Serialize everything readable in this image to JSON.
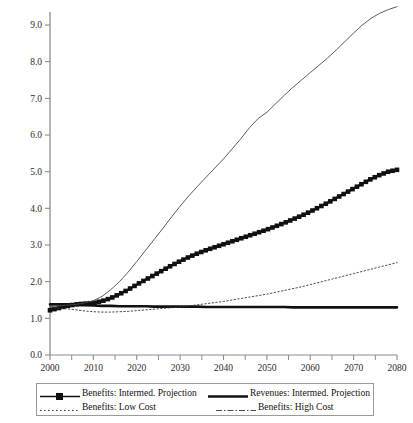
{
  "chart_data": {
    "type": "line",
    "title": "",
    "xlabel": "",
    "ylabel": "",
    "xlim": [
      2000,
      2080
    ],
    "ylim": [
      0.0,
      9.5
    ],
    "grid": false,
    "legend_position": "bottom",
    "x_ticks_major": [
      2000,
      2010,
      2020,
      2030,
      2040,
      2050,
      2060,
      2070,
      2080
    ],
    "x_ticks_minor": [
      2005,
      2015,
      2025,
      2035,
      2045,
      2055,
      2065,
      2075
    ],
    "x_tick_labels": [
      "2000",
      "2010",
      "2020",
      "2030",
      "2040",
      "2050",
      "2060",
      "2070",
      "2080"
    ],
    "y_ticks": [
      0.0,
      1.0,
      2.0,
      3.0,
      4.0,
      5.0,
      6.0,
      7.0,
      8.0,
      9.0
    ],
    "y_tick_labels": [
      "0.0",
      "1.0",
      "2.0",
      "3.0",
      "4.0",
      "5.0",
      "6.0",
      "7.0",
      "8.0",
      "9.0"
    ],
    "x": [
      2000,
      2002,
      2004,
      2006,
      2008,
      2010,
      2012,
      2014,
      2016,
      2018,
      2020,
      2022,
      2024,
      2026,
      2028,
      2030,
      2032,
      2034,
      2036,
      2038,
      2040,
      2042,
      2044,
      2046,
      2048,
      2050,
      2052,
      2054,
      2056,
      2058,
      2060,
      2062,
      2064,
      2066,
      2068,
      2070,
      2072,
      2074,
      2076,
      2078,
      2080
    ],
    "series": [
      {
        "name": "Benefits: Intermed. Projection",
        "style": "thick-line-square-markers",
        "color": "#101010",
        "values": [
          1.22,
          1.28,
          1.34,
          1.38,
          1.4,
          1.42,
          1.47,
          1.55,
          1.66,
          1.78,
          1.92,
          2.05,
          2.18,
          2.31,
          2.44,
          2.56,
          2.67,
          2.77,
          2.86,
          2.94,
          3.02,
          3.1,
          3.18,
          3.26,
          3.34,
          3.42,
          3.51,
          3.6,
          3.7,
          3.8,
          3.91,
          4.03,
          4.15,
          4.28,
          4.41,
          4.54,
          4.67,
          4.8,
          4.91,
          5.0,
          5.05
        ]
      },
      {
        "name": "Revenues: Intermed. Projection",
        "style": "thick-solid",
        "color": "#101010",
        "values": [
          1.38,
          1.38,
          1.38,
          1.37,
          1.36,
          1.35,
          1.34,
          1.34,
          1.33,
          1.33,
          1.33,
          1.33,
          1.32,
          1.32,
          1.32,
          1.32,
          1.32,
          1.32,
          1.31,
          1.31,
          1.31,
          1.31,
          1.31,
          1.31,
          1.31,
          1.31,
          1.31,
          1.31,
          1.3,
          1.3,
          1.3,
          1.3,
          1.3,
          1.3,
          1.3,
          1.3,
          1.3,
          1.3,
          1.3,
          1.3,
          1.3
        ]
      },
      {
        "name": "Benefits: Low Cost",
        "style": "fine-dotted",
        "color": "#3a3a3a",
        "values": [
          1.3,
          1.28,
          1.26,
          1.23,
          1.2,
          1.18,
          1.17,
          1.17,
          1.18,
          1.19,
          1.21,
          1.23,
          1.25,
          1.27,
          1.29,
          1.31,
          1.34,
          1.37,
          1.4,
          1.43,
          1.46,
          1.5,
          1.54,
          1.58,
          1.62,
          1.66,
          1.71,
          1.76,
          1.81,
          1.86,
          1.92,
          1.98,
          2.04,
          2.1,
          2.16,
          2.22,
          2.28,
          2.34,
          2.4,
          2.46,
          2.52
        ]
      },
      {
        "name": "Benefits: High Cost",
        "style": "fine-dash-dot",
        "color": "#4a4a4a",
        "values": [
          1.32,
          1.34,
          1.36,
          1.38,
          1.42,
          1.48,
          1.6,
          1.78,
          2.0,
          2.26,
          2.55,
          2.85,
          3.15,
          3.45,
          3.76,
          4.06,
          4.34,
          4.6,
          4.85,
          5.1,
          5.35,
          5.62,
          5.9,
          6.2,
          6.45,
          6.62,
          6.85,
          7.08,
          7.3,
          7.5,
          7.7,
          7.9,
          8.1,
          8.32,
          8.55,
          8.78,
          9.0,
          9.18,
          9.32,
          9.42,
          9.5
        ]
      }
    ]
  },
  "legend": {
    "entries": [
      {
        "label": "Benefits: Intermed. Projection",
        "style": "thick-line-square-markers"
      },
      {
        "label": "Revenues: Intermed. Projection",
        "style": "thick-solid"
      },
      {
        "label": "Benefits: Low Cost",
        "style": "fine-dotted"
      },
      {
        "label": "Benefits: High Cost",
        "style": "fine-dash-dot"
      }
    ]
  }
}
